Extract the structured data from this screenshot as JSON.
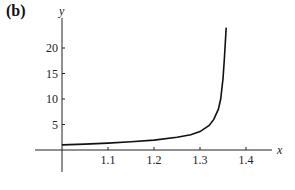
{
  "figure_label": "(b)",
  "chart_data": {
    "type": "line",
    "title": "",
    "xlabel": "x",
    "ylabel": "y",
    "x_ticks": [
      "1.1",
      "1.2",
      "1.3",
      "1.4"
    ],
    "y_ticks": [
      "5",
      "10",
      "15",
      "20"
    ],
    "xlim": [
      0.97,
      1.47
    ],
    "ylim": [
      -3,
      24
    ],
    "grid": false,
    "legend": null,
    "series": [
      {
        "name": "y(x)",
        "x": [
          1.0,
          1.05,
          1.1,
          1.15,
          1.2,
          1.25,
          1.28,
          1.3,
          1.32,
          1.33,
          1.34,
          1.345,
          1.35,
          1.353,
          1.355,
          1.357
        ],
        "y": [
          1.0,
          1.15,
          1.35,
          1.6,
          1.95,
          2.5,
          3.0,
          3.6,
          4.8,
          6.0,
          8.0,
          10.0,
          14.0,
          18.0,
          21.0,
          24.0
        ]
      }
    ],
    "vertical_asymptote_x": 1.357
  },
  "axes": {
    "x_label": "x",
    "y_label": "y",
    "x_ticks": [
      {
        "label": "1.1",
        "value": 1.1
      },
      {
        "label": "1.2",
        "value": 1.2
      },
      {
        "label": "1.3",
        "value": 1.3
      },
      {
        "label": "1.4",
        "value": 1.4
      }
    ],
    "y_ticks": [
      {
        "label": "5",
        "value": 5
      },
      {
        "label": "10",
        "value": 10
      },
      {
        "label": "15",
        "value": 15
      },
      {
        "label": "20",
        "value": 20
      }
    ]
  },
  "colors": {
    "axis": "#222222",
    "curve": "#111111",
    "text": "#222222"
  }
}
